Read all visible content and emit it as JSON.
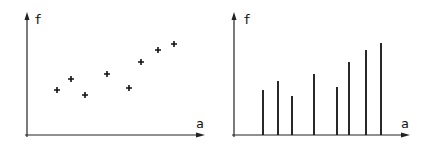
{
  "chart_data": [
    {
      "type": "scatter",
      "title": "",
      "xlabel": "a",
      "ylabel": "f",
      "marker": "+",
      "grid": false,
      "points": [
        {
          "x": 57,
          "y": 90
        },
        {
          "x": 71,
          "y": 79
        },
        {
          "x": 85,
          "y": 95
        },
        {
          "x": 107,
          "y": 74
        },
        {
          "x": 129,
          "y": 88
        },
        {
          "x": 141,
          "y": 62
        },
        {
          "x": 158,
          "y": 50
        },
        {
          "x": 174,
          "y": 44
        }
      ],
      "axis": {
        "origin_x": 27,
        "origin_y": 135,
        "x_end": 205,
        "y_top": 12
      },
      "label_pos": {
        "x": [
          196,
          128
        ],
        "y": [
          34,
          24
        ]
      }
    },
    {
      "type": "bar",
      "style": "stem",
      "title": "",
      "xlabel": "a",
      "ylabel": "f",
      "grid": false,
      "points": [
        {
          "x": 263,
          "y": 90
        },
        {
          "x": 278,
          "y": 81
        },
        {
          "x": 292,
          "y": 96
        },
        {
          "x": 314,
          "y": 74
        },
        {
          "x": 337,
          "y": 87
        },
        {
          "x": 349,
          "y": 62
        },
        {
          "x": 366,
          "y": 50
        },
        {
          "x": 381,
          "y": 43
        }
      ],
      "axis": {
        "origin_x": 234,
        "origin_y": 135,
        "x_end": 410,
        "y_top": 12
      },
      "label_pos": {
        "x": [
          401,
          128
        ],
        "y": [
          243,
          24
        ]
      }
    }
  ]
}
